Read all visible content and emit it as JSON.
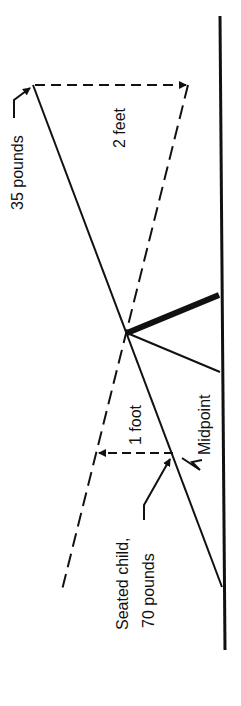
{
  "diagram": {
    "labels": {
      "weight_left": "35 pounds",
      "distance_left": "2 feet",
      "distance_child": "1 foot",
      "midpoint": "Midpoint",
      "child_line1": "Seated child,",
      "child_line2": "70 pounds"
    },
    "colors": {
      "ink": "#111111",
      "background": "#ffffff"
    }
  }
}
